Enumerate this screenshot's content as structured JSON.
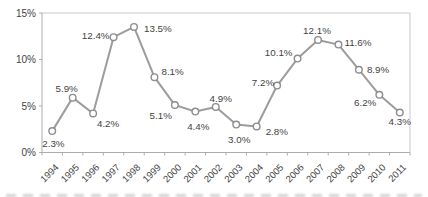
{
  "chart_data": {
    "type": "line",
    "title": "",
    "xlabel": "",
    "ylabel": "",
    "categories": [
      "1994",
      "1995",
      "1996",
      "1997",
      "1998",
      "1999",
      "2000",
      "2001",
      "2002",
      "2003",
      "2004",
      "2005",
      "2006",
      "2007",
      "2008",
      "2009",
      "2010",
      "2011"
    ],
    "values": [
      2.3,
      5.9,
      4.2,
      12.4,
      13.5,
      8.1,
      5.1,
      4.4,
      4.9,
      3.0,
      2.8,
      7.2,
      10.1,
      12.1,
      11.6,
      8.9,
      6.2,
      4.3
    ],
    "data_labels": [
      "2.3%",
      "5.9%",
      "4.2%",
      "12.4%",
      "13.5%",
      "8.1%",
      "5.1%",
      "4.4%",
      "4.9%",
      "3.0%",
      "2.8%",
      "7.2%",
      "10.1%",
      "12.1%",
      "11.6%",
      "8.9%",
      "6.2%",
      "4.3%"
    ],
    "ylim": [
      0,
      15
    ],
    "ytick_values": [
      0,
      5,
      10,
      15
    ],
    "ytick_labels": [
      "0%",
      "5%",
      "10%",
      "15%"
    ],
    "grid": false,
    "legend": "none",
    "marker": "open-circle",
    "colors": {
      "line": "#9c9c9c",
      "marker_fill": "#ffffff",
      "marker_stroke": "#8d8d8d",
      "label_text": "#3f3f3f",
      "axis_text": "#3f3f3f",
      "axis_line": "#adadad",
      "plot_border": "#c8c8c8",
      "background": "#ffffff"
    },
    "layout": {
      "width": 428,
      "height": 197,
      "plot": {
        "left": 42,
        "top": 13,
        "right": 410,
        "bottom": 152.5
      },
      "line_width": 2,
      "marker_radius": 3.3,
      "data_label_font_size": 9.8,
      "axis_font_size": 10,
      "xtick_font_size": 9.5,
      "xlabel_rotation": -45,
      "label_offsets": [
        [
          -10,
          16,
          "start"
        ],
        [
          -6,
          -6,
          "middle"
        ],
        [
          15,
          14,
          "middle"
        ],
        [
          -4,
          2,
          "end"
        ],
        [
          10,
          5,
          "start"
        ],
        [
          7,
          -2,
          "start"
        ],
        [
          -3,
          14,
          "end"
        ],
        [
          3,
          18,
          "middle"
        ],
        [
          5,
          -5,
          "middle"
        ],
        [
          3,
          18,
          "middle"
        ],
        [
          9,
          9,
          "start"
        ],
        [
          -3,
          0,
          "end"
        ],
        [
          -5,
          -3,
          "end"
        ],
        [
          -1,
          -6,
          "middle"
        ],
        [
          6,
          1,
          "start"
        ],
        [
          8,
          3,
          "start"
        ],
        [
          -3,
          11,
          "end"
        ],
        [
          0,
          12,
          "middle"
        ]
      ]
    }
  }
}
